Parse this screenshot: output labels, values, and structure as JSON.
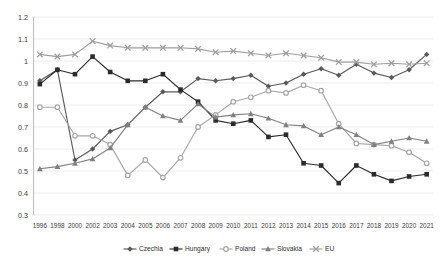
{
  "chart_data": {
    "type": "line",
    "title": "",
    "subtitle": "",
    "xlabel": "",
    "ylabel": "",
    "ylim": [
      0.3,
      1.2
    ],
    "ytick_step": 0.1,
    "yticks": [
      "0.3",
      "0.4",
      "0.5",
      "0.6",
      "0.7",
      "0.8",
      "0.9",
      "1",
      "1.1",
      "1.2"
    ],
    "grid": true,
    "legend_position": "bottom",
    "categories": [
      "1996",
      "1998",
      "2000",
      "2002",
      "2003",
      "2004",
      "2005",
      "2006",
      "2007",
      "2008",
      "2009",
      "2010",
      "2011",
      "2012",
      "2013",
      "2014",
      "2015",
      "2016",
      "2017",
      "2018",
      "2019",
      "2020",
      "2021"
    ],
    "series": [
      {
        "name": "Czechia",
        "marker": "diamond",
        "color": "#595959",
        "values": [
          0.91,
          0.96,
          0.55,
          0.6,
          0.68,
          0.71,
          0.79,
          0.86,
          0.86,
          0.92,
          0.91,
          0.92,
          0.935,
          0.885,
          0.9,
          0.94,
          0.965,
          0.935,
          0.985,
          0.945,
          0.925,
          0.96,
          1.03
        ]
      },
      {
        "name": "Hungary",
        "marker": "square",
        "color": "#2b2b2b",
        "values": [
          0.895,
          0.96,
          0.94,
          1.02,
          0.95,
          0.91,
          0.91,
          0.94,
          0.87,
          0.815,
          0.73,
          0.715,
          0.73,
          0.655,
          0.665,
          0.535,
          0.525,
          0.445,
          0.525,
          0.485,
          0.455,
          0.475,
          0.485
        ]
      },
      {
        "name": "Poland",
        "marker": "circle",
        "color": "#a6a6a6",
        "values": [
          0.79,
          0.79,
          0.66,
          0.66,
          0.62,
          0.48,
          0.55,
          0.47,
          0.56,
          0.7,
          0.755,
          0.815,
          0.835,
          0.865,
          0.855,
          0.89,
          0.865,
          0.715,
          0.625,
          0.62,
          0.615,
          0.585,
          0.535
        ]
      },
      {
        "name": "Slovakia",
        "marker": "triangle",
        "color": "#808080",
        "values": [
          0.51,
          0.52,
          0.535,
          0.555,
          0.605,
          0.71,
          0.79,
          0.75,
          0.73,
          0.805,
          0.745,
          0.755,
          0.76,
          0.74,
          0.71,
          0.705,
          0.665,
          0.7,
          0.665,
          0.62,
          0.635,
          0.65,
          0.635
        ]
      },
      {
        "name": "EU",
        "marker": "cross",
        "color": "#9e9e9e",
        "values": [
          1.03,
          1.02,
          1.03,
          1.09,
          1.07,
          1.06,
          1.06,
          1.06,
          1.06,
          1.055,
          1.04,
          1.045,
          1.035,
          1.025,
          1.035,
          1.025,
          1.015,
          0.995,
          0.995,
          0.985,
          0.99,
          0.985,
          0.99
        ]
      }
    ]
  },
  "legend": {
    "entries": [
      {
        "label": "Czechia"
      },
      {
        "label": "Hungary"
      },
      {
        "label": "Poland"
      },
      {
        "label": "Slovakia"
      },
      {
        "label": "EU"
      }
    ]
  }
}
